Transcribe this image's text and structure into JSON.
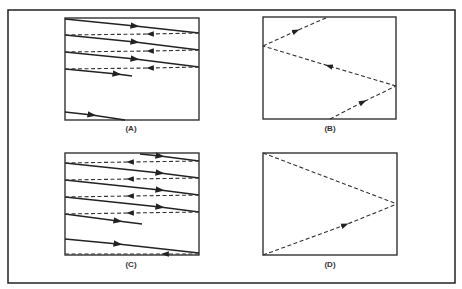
{
  "figure": {
    "panels": [
      {
        "id": "A",
        "label": "(A)"
      },
      {
        "id": "B",
        "label": "(B)"
      },
      {
        "id": "C",
        "label": "(C)"
      },
      {
        "id": "D",
        "label": "(D)"
      }
    ],
    "legend_semantics": {
      "solid_line": "forward trace",
      "dashed_line": "retrace"
    },
    "colors": {
      "line": "#222222",
      "background": "#ffffff"
    }
  }
}
